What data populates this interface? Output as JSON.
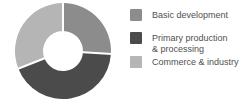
{
  "chart_data": {
    "type": "pie",
    "subtype": "donut",
    "title": "",
    "legend_position": "right",
    "start_angle_deg": 0,
    "inner_radius_ratio": 0.42,
    "categories": [
      "Basic development",
      "Primary production & processing",
      "Commerce & industry"
    ],
    "values": [
      26,
      43,
      31
    ],
    "colors": [
      "#8c8c8c",
      "#4b4b4b",
      "#b5b5b5"
    ],
    "separator_color": "#ffffff",
    "legend": [
      {
        "label": "Basic development",
        "color": "#8c8c8c"
      },
      {
        "label": "Primary production\n& processing",
        "color": "#4b4b4b"
      },
      {
        "label": "Commerce & industry",
        "color": "#b5b5b5"
      }
    ]
  }
}
